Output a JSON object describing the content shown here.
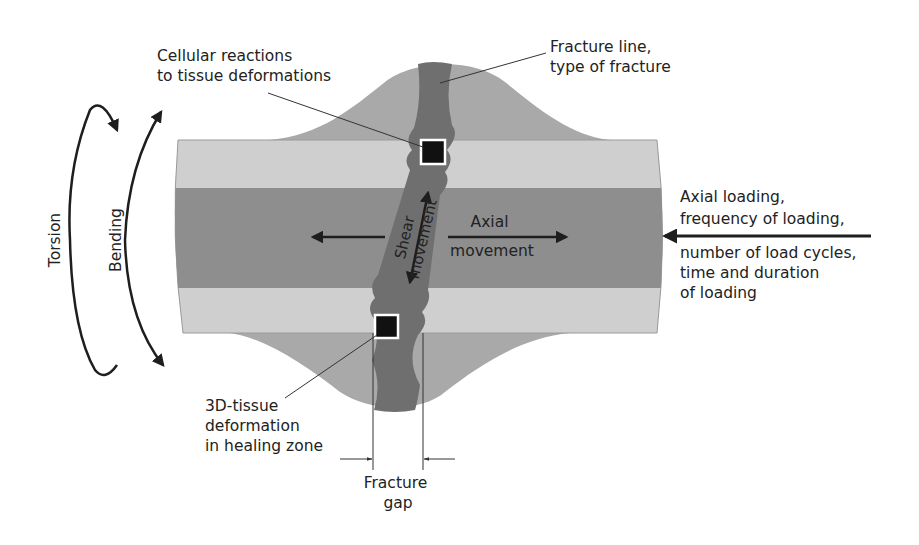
{
  "colors": {
    "background": "#ffffff",
    "cortex_light": "#cfcfcf",
    "medulla_dark": "#8e8e8e",
    "callus": "#a9a9a9",
    "fracture_zone": "#6f6f6f",
    "marker_fill": "#111111",
    "marker_border": "#ffffff",
    "ink": "#222222"
  },
  "labels": {
    "cellular_reactions": [
      "Cellular reactions",
      "to tissue deformations"
    ],
    "fracture_line": [
      "Fracture line,",
      "type of fracture"
    ],
    "axial_loading_above": [
      "Axial loading,",
      "frequency of loading,"
    ],
    "axial_loading_below": [
      "number of load cycles,",
      "time and duration",
      "of loading"
    ],
    "shear_movement": [
      "Shear",
      "movement"
    ],
    "axial_movement": [
      "Axial",
      "movement"
    ],
    "torsion": "Torsion",
    "bending": "Bending",
    "tissue_deformation": [
      "3D-tissue",
      "deformation",
      "in healing zone"
    ],
    "fracture_gap": [
      "Fracture",
      "gap"
    ]
  },
  "icons": {
    "torsion_arrow": "curved-double-arrow",
    "bending_arrow": "curved-double-arrow",
    "axial_load_arrow": "left-arrow",
    "axial_movement_arrow": "left-right-arrow",
    "shear_movement_arrow": "diagonal-double-arrow",
    "gap_dimension_arrows": "inward-arrows",
    "cell_markers": "black-square"
  }
}
